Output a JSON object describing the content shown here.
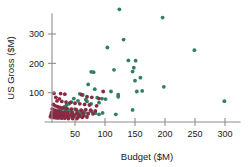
{
  "chart_data": {
    "type": "scatter",
    "title": "",
    "xlabel": "Budget ($M)",
    "ylabel": "US Gross ($M)",
    "xlim": [
      0,
      315
    ],
    "ylim": [
      0,
      400
    ],
    "xticks": [
      50,
      100,
      150,
      200,
      250,
      300
    ],
    "xtick_labels": [
      "50",
      "100",
      "150",
      "200",
      "250",
      "300"
    ],
    "yticks": [
      100,
      200,
      300
    ],
    "ytick_labels": [
      "100",
      "200",
      "300"
    ],
    "grid": false,
    "legend": "none",
    "series": [
      {
        "name": "green-series",
        "color": "#2f7f63",
        "marker": "circle",
        "points": [
          [
            124,
            384
          ],
          [
            196,
            356
          ],
          [
            131,
            281
          ],
          [
            104,
            254
          ],
          [
            249,
            245
          ],
          [
            139,
            210
          ],
          [
            151,
            209
          ],
          [
            148,
            185
          ],
          [
            115,
            178
          ],
          [
            146,
            172
          ],
          [
            159,
            151
          ],
          [
            150,
            141
          ],
          [
            77,
            171
          ],
          [
            81,
            170
          ],
          [
            198,
            120
          ],
          [
            162,
            106
          ],
          [
            153,
            104
          ],
          [
            72,
            128
          ],
          [
            83,
            112
          ],
          [
            110,
            104
          ],
          [
            122,
            93
          ],
          [
            122,
            86
          ],
          [
            299,
            71
          ],
          [
            146,
            41
          ],
          [
            58,
            96
          ],
          [
            63,
            92
          ],
          [
            87,
            83
          ],
          [
            95,
            80
          ],
          [
            101,
            78
          ],
          [
            68,
            76
          ],
          [
            70,
            70
          ],
          [
            90,
            66
          ],
          [
            77,
            62
          ],
          [
            55,
            72
          ],
          [
            48,
            80
          ],
          [
            44,
            68
          ],
          [
            40,
            62
          ],
          [
            36,
            58
          ],
          [
            33,
            52
          ],
          [
            30,
            48
          ],
          [
            27,
            44
          ],
          [
            24,
            40
          ],
          [
            21,
            36
          ],
          [
            19,
            33
          ],
          [
            17,
            30
          ],
          [
            15,
            28
          ],
          [
            13,
            26
          ],
          [
            12,
            24
          ],
          [
            34,
            40
          ],
          [
            38,
            44
          ],
          [
            42,
            38
          ],
          [
            46,
            34
          ],
          [
            50,
            44
          ],
          [
            54,
            36
          ],
          [
            58,
            30
          ],
          [
            62,
            38
          ],
          [
            66,
            33
          ],
          [
            72,
            28
          ],
          [
            78,
            36
          ],
          [
            84,
            30
          ],
          [
            90,
            26
          ],
          [
            96,
            31
          ],
          [
            118,
            26
          ],
          [
            28,
            34
          ],
          [
            31,
            30
          ],
          [
            25,
            28
          ],
          [
            22,
            26
          ],
          [
            20,
            24
          ],
          [
            18,
            22
          ],
          [
            16,
            20
          ],
          [
            14,
            18
          ],
          [
            43,
            26
          ],
          [
            47,
            22
          ],
          [
            52,
            28
          ],
          [
            56,
            24
          ],
          [
            60,
            20
          ],
          [
            36,
            24
          ],
          [
            39,
            20
          ],
          [
            29,
            19
          ],
          [
            26,
            17
          ],
          [
            23,
            15
          ]
        ]
      },
      {
        "name": "maroon-series",
        "color": "#8b2942",
        "marker": "circle",
        "points": [
          [
            15,
            98
          ],
          [
            26,
            97
          ],
          [
            33,
            95
          ],
          [
            97,
            104
          ],
          [
            61,
            93
          ],
          [
            18,
            84
          ],
          [
            24,
            79
          ],
          [
            70,
            86
          ],
          [
            78,
            84
          ],
          [
            90,
            80
          ],
          [
            20,
            72
          ],
          [
            28,
            70
          ],
          [
            35,
            68
          ],
          [
            42,
            66
          ],
          [
            50,
            64
          ],
          [
            58,
            62
          ],
          [
            66,
            60
          ],
          [
            74,
            58
          ],
          [
            86,
            55
          ],
          [
            14,
            60
          ],
          [
            17,
            55
          ],
          [
            21,
            52
          ],
          [
            25,
            50
          ],
          [
            30,
            48
          ],
          [
            36,
            46
          ],
          [
            44,
            44
          ],
          [
            52,
            42
          ],
          [
            60,
            40
          ],
          [
            68,
            42
          ],
          [
            76,
            40
          ],
          [
            84,
            38
          ],
          [
            12,
            44
          ],
          [
            16,
            40
          ],
          [
            19,
            38
          ],
          [
            23,
            36
          ],
          [
            27,
            34
          ],
          [
            32,
            33
          ],
          [
            38,
            32
          ],
          [
            45,
            31
          ],
          [
            54,
            30
          ],
          [
            63,
            30
          ],
          [
            72,
            29
          ],
          [
            80,
            28
          ],
          [
            11,
            32
          ],
          [
            14,
            30
          ],
          [
            18,
            28
          ],
          [
            22,
            27
          ],
          [
            26,
            26
          ],
          [
            31,
            25
          ],
          [
            37,
            24
          ],
          [
            43,
            23
          ],
          [
            49,
            23
          ],
          [
            57,
            22
          ],
          [
            65,
            22
          ],
          [
            10,
            24
          ],
          [
            13,
            22
          ],
          [
            16,
            21
          ],
          [
            20,
            20
          ],
          [
            24,
            19
          ],
          [
            29,
            18
          ],
          [
            34,
            18
          ],
          [
            40,
            17
          ],
          [
            47,
            17
          ],
          [
            55,
            16
          ],
          [
            62,
            16
          ],
          [
            70,
            17
          ],
          [
            9,
            18
          ],
          [
            12,
            16
          ],
          [
            15,
            15
          ],
          [
            19,
            14
          ],
          [
            23,
            14
          ],
          [
            28,
            13
          ],
          [
            33,
            13
          ],
          [
            39,
            12
          ],
          [
            46,
            12
          ],
          [
            53,
            12
          ]
        ]
      }
    ]
  }
}
